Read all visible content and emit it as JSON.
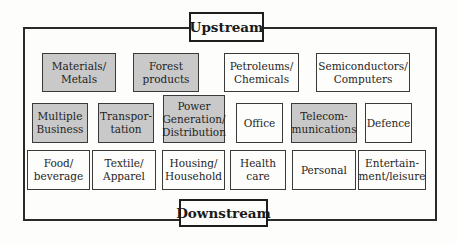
{
  "diagram": {
    "top_label": "Upstream",
    "bottom_label": "Downstream",
    "colors": {
      "shaded": "#c9c9c9",
      "unshaded": "#fdfdfb",
      "border": "#2a2a2a"
    },
    "rows": [
      {
        "boxes": [
          {
            "label": "Materials/\nMetals",
            "shaded": true
          },
          {
            "label": "Forest\nproducts",
            "shaded": true
          },
          {
            "label": "Petroleums/\nChemicals",
            "shaded": false
          },
          {
            "label": "Semiconductors/\nComputers",
            "shaded": false
          }
        ]
      },
      {
        "boxes": [
          {
            "label": "Multiple\nBusiness",
            "shaded": true
          },
          {
            "label": "Transpor-\ntation",
            "shaded": true
          },
          {
            "label": "Power\nGeneration/\nDistribution",
            "shaded": true
          },
          {
            "label": "Office",
            "shaded": false
          },
          {
            "label": "Telecom-\nmunications",
            "shaded": true
          },
          {
            "label": "Defence",
            "shaded": false
          }
        ]
      },
      {
        "boxes": [
          {
            "label": "Food/\nbeverage",
            "shaded": false
          },
          {
            "label": "Textile/\nApparel",
            "shaded": false
          },
          {
            "label": "Housing/\nHousehold",
            "shaded": false
          },
          {
            "label": "Health\ncare",
            "shaded": false
          },
          {
            "label": "Personal",
            "shaded": false
          },
          {
            "label": "Entertain-\nment/leisure",
            "shaded": false
          }
        ]
      }
    ]
  }
}
